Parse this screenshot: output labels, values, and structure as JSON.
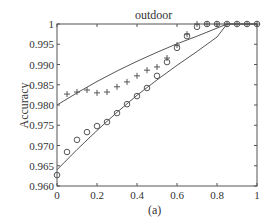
{
  "chart_data": {
    "type": "scatter",
    "title": "outdoor",
    "caption": "(a)",
    "xlabel": "",
    "ylabel": "Accuracy",
    "xlim": [
      0,
      1
    ],
    "ylim": [
      0.96,
      1.0
    ],
    "x_ticks": [
      "0",
      "0.2",
      "0.4",
      "0.6",
      "0.8",
      "1"
    ],
    "y_ticks": [
      "0.960",
      "0.965",
      "0.970",
      "0.975",
      "0.980",
      "0.985",
      "0.990",
      "0.995",
      "1"
    ],
    "grid": false,
    "legend": null,
    "series": [
      {
        "name": "plus markers",
        "marker": "+",
        "x": [
          0.05,
          0.1,
          0.15,
          0.2,
          0.25,
          0.3,
          0.35,
          0.4,
          0.45,
          0.5,
          0.55,
          0.6,
          0.65,
          0.7,
          0.75,
          0.8,
          0.85,
          0.9,
          0.95,
          1.0
        ],
        "y": [
          0.9827,
          0.9832,
          0.9837,
          0.983,
          0.9832,
          0.9845,
          0.9857,
          0.9872,
          0.9886,
          0.9894,
          0.9916,
          0.9948,
          0.9975,
          1.0,
          1.0,
          1.0,
          1.0,
          1.0,
          1.0,
          1.0
        ]
      },
      {
        "name": "circle markers",
        "marker": "o",
        "x": [
          0,
          0.05,
          0.1,
          0.15,
          0.2,
          0.25,
          0.3,
          0.35,
          0.4,
          0.45,
          0.5,
          0.55,
          0.6,
          0.65,
          0.7,
          0.75,
          0.8,
          0.85,
          0.9,
          0.95,
          1.0
        ],
        "y": [
          0.9627,
          0.9684,
          0.9714,
          0.9733,
          0.9748,
          0.9758,
          0.978,
          0.9802,
          0.9822,
          0.9842,
          0.9872,
          0.9906,
          0.9941,
          0.997,
          0.9993,
          1.0,
          1.0,
          1.0,
          1.0,
          1.0,
          1.0
        ]
      },
      {
        "name": "plus fit curve",
        "marker": "line",
        "x": [
          0,
          0.1,
          0.2,
          0.3,
          0.4,
          0.5,
          0.6,
          0.7,
          0.8,
          0.85,
          0.9,
          1.0
        ],
        "y": [
          0.98,
          0.983,
          0.9858,
          0.9884,
          0.9908,
          0.993,
          0.9951,
          0.997,
          0.999,
          1.0,
          1.0,
          1.0
        ]
      },
      {
        "name": "circle fit curve",
        "marker": "line",
        "x": [
          0,
          0.1,
          0.2,
          0.3,
          0.4,
          0.5,
          0.6,
          0.7,
          0.8,
          0.85,
          0.9,
          1.0
        ],
        "y": [
          0.964,
          0.969,
          0.9737,
          0.9782,
          0.9824,
          0.9862,
          0.9898,
          0.9932,
          0.9968,
          1.0,
          1.0,
          1.0
        ]
      }
    ]
  }
}
